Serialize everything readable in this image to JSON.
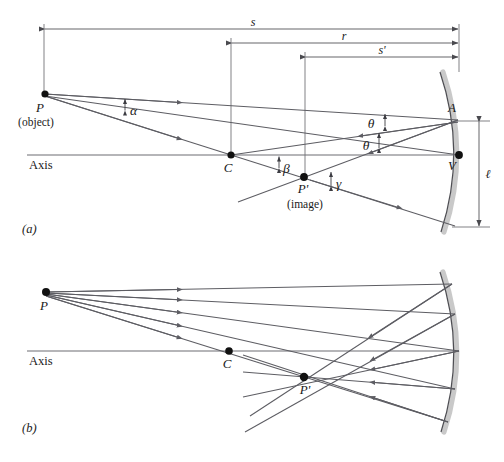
{
  "figure": {
    "background": "#ffffff",
    "ray_color": "#5d5d63",
    "mirror_glass_color": "#c9c9c9",
    "mirror_face_color": "#4e4e53",
    "point_color": "#111111"
  },
  "panel_a": {
    "label": "(a)",
    "axis_label": "Axis",
    "points": {
      "P": "P",
      "P_sub": "(object)",
      "C": "C",
      "P_prime": "P'",
      "P_prime_sub": "(image)",
      "A": "A",
      "V": "V"
    },
    "dimensions": {
      "s": "s",
      "r": "r",
      "s_prime": "s'",
      "l": "ℓ"
    },
    "angles": {
      "alpha": "α",
      "beta": "β",
      "gamma": "γ",
      "theta_incident": "θ",
      "theta_reflected": "θ"
    }
  },
  "panel_b": {
    "label": "(b)",
    "axis_label": "Axis",
    "points": {
      "P": "P",
      "C": "C",
      "P_prime": "P'"
    },
    "ray_count": 5
  }
}
